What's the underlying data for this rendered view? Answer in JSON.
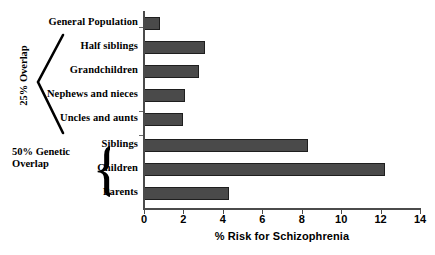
{
  "chart_data": {
    "type": "bar",
    "orientation": "horizontal",
    "title": "",
    "xlabel": "% Risk for Schizophrenia",
    "ylabel": "",
    "xlim": [
      0,
      14
    ],
    "xticks": [
      0,
      2,
      4,
      6,
      8,
      10,
      12,
      14
    ],
    "xtick_labels": [
      "0",
      "2",
      "4",
      "6",
      "8",
      "10",
      "12",
      "14"
    ],
    "grid": false,
    "legend": null,
    "bar_color": "#4a4a4a",
    "bar_edge_color": "#1e1e1e",
    "categories": [
      "General Population",
      "Half siblings",
      "Grandchildren",
      "Nephews and nieces",
      "Uncles and aunts",
      "Siblings",
      "Children",
      "Parents"
    ],
    "values": [
      0.8,
      3.1,
      2.8,
      2.1,
      2.0,
      8.3,
      12.2,
      4.3
    ],
    "annotations": [
      {
        "id": "overlap-25",
        "text": "25% Overlap",
        "bracket": "angular",
        "orientation": "vertical",
        "covers": [
          "Half siblings",
          "Grandchildren",
          "Nephews and nieces",
          "Uncles and aunts"
        ]
      },
      {
        "id": "overlap-50",
        "text_line_1": "50% Genetic",
        "text_line_2": "Overlap",
        "brace_glyph": "{",
        "bracket": "curly",
        "orientation": "horizontal",
        "covers": [
          "Siblings",
          "Children",
          "Parents"
        ]
      }
    ]
  }
}
